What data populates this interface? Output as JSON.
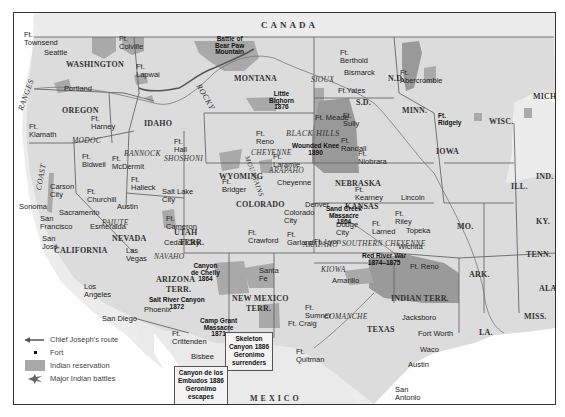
{
  "colors": {
    "land": "#e4e4e4",
    "water": "#ffffff",
    "reservation": "#a9a9a9",
    "reservation_dark": "#8f8f8f",
    "border": "#555555",
    "river": "#555555"
  },
  "countries": {
    "canada": "CANADA",
    "mexico": "MEXICO"
  },
  "states": {
    "washington": "WASHINGTON",
    "oregon": "OREGON",
    "california": "CALIFORNIA",
    "nevada": "NEVADA",
    "idaho": "IDAHO",
    "montana": "MONTANA",
    "wyoming": "WYOMING",
    "utah": "UTAH",
    "utah2": "TERR.",
    "colorado": "COLORADO",
    "arizona": "ARIZONA",
    "arizona2": "TERR.",
    "newmexico": "NEW MEXICO",
    "newmexico2": "TERR.",
    "nd": "N.D.",
    "sd": "S.D.",
    "nebraska": "NEBRASKA",
    "kansas": "KANSAS",
    "indianterr": "INDIAN TERR.",
    "texas": "TEXAS",
    "minn": "MINN.",
    "iowa": "IOWA",
    "mo": "MO.",
    "ark": "ARK.",
    "la": "LA.",
    "wisc": "WISC.",
    "ill": "ILL.",
    "mich": "MICH.",
    "ind": "IND.",
    "ky": "KY.",
    "tenn": "TENN.",
    "miss": "MISS.",
    "ala": "ALA."
  },
  "ranges": {
    "coast": "COAST",
    "ranges": "RANGES",
    "rocky": "ROCKY",
    "mountains": "MOUNTAINS",
    "blackhills": "BLACK HILLS"
  },
  "tribes": {
    "modoc": "MODOC",
    "bannock": "BANNOCK",
    "shoshoni": "SHOSHONI",
    "paiute": "PAIUTE",
    "navaho": "NAVAHO",
    "sioux": "SIOUX",
    "cheyenne": "CHEYENNE",
    "arapaho_wy": "ARAPAHO",
    "arapaho_co": "ARAPAHO",
    "southern_cheyenne": "SOUTHERN CHEYENNE",
    "kiowa": "KIOWA",
    "comanche": "COMANCHE"
  },
  "places": {
    "townsend": "Ft.\nTownsend",
    "seattle": "Seattle",
    "colville": "Ft.\nColville",
    "lapwai": "Ft.\nLapwai",
    "portland": "Portland",
    "harney": "Ft.\nHarney",
    "klamath": "Ft.\nKlamath",
    "bidwell": "Ft.\nBidwell",
    "mcdermit": "Ft.\nMcDermit",
    "halleck": "Ft.\nHalleck",
    "hall": "Ft.\nHall",
    "carson": "Carson\nCity",
    "churchill": "Ft.\nChurchill",
    "austin": "Austin",
    "sacramento": "Sacramento",
    "sonoma": "Sonoma",
    "sanfrancisco": "San\nFrancisco",
    "sanjose": "San\nJosé",
    "esmeralda": "Esmeralda",
    "lasvegas": "Las\nVegas",
    "saltlake": "Salt Lake\nCity",
    "cameron": "Ft.\nCameron",
    "cedarcity": "Cedar City",
    "losangeles": "Los\nAngeles",
    "sandiego": "San Diego",
    "phoenix": "Phoenix",
    "crittenden": "Ft.\nCrittenden",
    "bisbee": "Bisbee",
    "bridger": "Ft.\nBridger",
    "reno_wy": "Ft.\nReno",
    "laramie": "Ft.\nLaramie",
    "cheyenne_city": "Cheyenne",
    "denver": "Denver",
    "coloradocity": "Colorado\nCity",
    "crawford": "Ft.\nCrawford",
    "garland": "Ft.\nGarland",
    "lyon": "Ft. Lyon",
    "santafe": "Santa\nFe",
    "craig": "Ft. Craig",
    "sumner": "Ft.\nSumner",
    "quitman": "Ft.\nQuitman",
    "berthold": "Ft.\nBerthold",
    "bismarck": "Bismarck",
    "yates": "Ft.Yates",
    "meade": "Ft. Meade",
    "sully": "Ft.\nSully",
    "randall": "Ft.\nRandall",
    "niobrara": "Ft.\nNiobrara",
    "kearney": "Ft.\nKearney",
    "lincoln": "Lincoln",
    "riley": "Ft.\nRiley",
    "topeka": "Topeka",
    "larned": "Ft.\nLarned",
    "dodge": "Dodge\nCity",
    "wichita": "Wichita",
    "reno_ok": "Ft. Reno",
    "amarillo": "Amarillo",
    "jacksboro": "Jacksboro",
    "fortworth": "Fort Worth",
    "waco": "Waco",
    "austin_tx": "Austin",
    "sanantonio": "San\nAntonio",
    "abercrombie": "Ft.\nAbercrombie",
    "ridgely": "Ft.\nRidgely"
  },
  "battles": {
    "bearpaw": "Battle of\nBear Paw\nMountain",
    "littlebighorn": "Little\nBighorn\n1876",
    "woundedknee": "Wounded Knee\n1890",
    "sandcreek": "Sand Creek\nMassacre\n1864",
    "redriver": "Red River War\n1874–1875",
    "canyondechelly": "Canyon\nde Chelly\n1864",
    "saltriver": "Salt River Canyon\n1872",
    "campgrant": "Camp Grant\nMassacre\n1871"
  },
  "callouts": {
    "skeleton": "Skeleton\nCanyon 1886\nGeronimo\nsurrenders",
    "embudos": "Canyon de los\nEmbudos 1886\nGeronimo\nescapes"
  },
  "legend": {
    "items": [
      {
        "icon": "arrow-icon",
        "label": "Chief Joseph's route"
      },
      {
        "icon": "fort-icon",
        "label": "Fort"
      },
      {
        "icon": "reservation-swatch",
        "label": "Indian reservation"
      },
      {
        "icon": "battle-icon",
        "label": "Major Indian battles"
      }
    ]
  }
}
